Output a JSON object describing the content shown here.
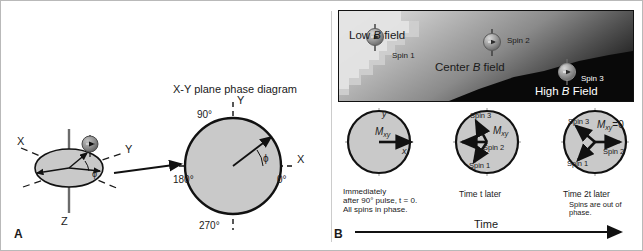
{
  "figure": {
    "panels": [
      {
        "id": "A",
        "label": "A"
      },
      {
        "id": "B",
        "label": "B"
      }
    ]
  },
  "panel_a": {
    "title": "X-Y plane phase diagram",
    "axes_3d": {
      "x": "X",
      "y": "Y",
      "z": "Z",
      "phi": "ϕ"
    },
    "phase_circle": {
      "axis_x": "X",
      "axis_y": "Y",
      "angle_top": "90°",
      "angle_left": "180°",
      "angle_bottom": "270°",
      "angle_right": "0°",
      "phi": "ϕ"
    },
    "spin_icon": "spin-sphere-icon",
    "arrow": "transition-arrow"
  },
  "panel_b": {
    "field_map": {
      "low_label_pre": "Low ",
      "low_label_ital": "B",
      "low_label_post": " field",
      "center_label_pre": "Center ",
      "center_label_ital": "B",
      "center_label_post": " field",
      "high_label_pre": "High ",
      "high_label_ital": "B",
      "high_label_post": " Field",
      "spin1": "Spin 1",
      "spin2": "Spin 2",
      "spin3": "Spin 3"
    },
    "time_axis_label": "Time",
    "diagrams": [
      {
        "id": "t0",
        "axis_x": "x",
        "axis_y": "y",
        "magnetization": "M",
        "magnetization_sub": "xy",
        "caption_lines": [
          "Immediately",
          "after 90° pulse, t = 0.",
          "All spins in phase."
        ],
        "vectors": [
          {
            "name": "Mxy",
            "angle_deg": 0,
            "length": 1.0
          }
        ],
        "spin_labels": []
      },
      {
        "id": "t",
        "magnetization": "M",
        "magnetization_sub": "xy",
        "caption_lines": [
          "Time t later"
        ],
        "vectors": [
          {
            "name": "Spin 3",
            "angle_deg": 118,
            "length": 0.78
          },
          {
            "name": "Spin 2",
            "angle_deg": 180,
            "length": 0.8
          },
          {
            "name": "Spin 1",
            "angle_deg": 232,
            "length": 0.78
          }
        ],
        "spin_labels": [
          "Spin 3",
          "Spin 2",
          "Spin 1"
        ]
      },
      {
        "id": "2t",
        "magnetization": "M",
        "magnetization_sub": "xy",
        "magnetization_eq": "=0",
        "caption_lines": [
          "Time 2t later",
          "Spins are out of",
          "phase."
        ],
        "vectors": [
          {
            "name": "Spin 3",
            "angle_deg": 140,
            "length": 0.8
          },
          {
            "name": "Spin 2",
            "angle_deg": 0,
            "length": 0.8
          },
          {
            "name": "Spin 1",
            "angle_deg": 228,
            "length": 0.8
          }
        ],
        "spin_labels": [
          "Spin 3",
          "Spin 2",
          "Spin 1"
        ]
      }
    ]
  },
  "colors": {
    "disk_fill": "#c9c9c9",
    "stroke": "#111111",
    "frame": "#b9b9b9",
    "text": "#1a1a1a",
    "white_text": "#ffffff"
  }
}
